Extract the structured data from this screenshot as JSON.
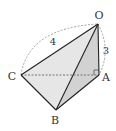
{
  "diagram": {
    "type": "geometry-tetrahedron",
    "vertices": [
      {
        "id": "O",
        "label": "O",
        "x": 98,
        "y": 24,
        "lx": 99,
        "ly": 19
      },
      {
        "id": "A",
        "label": "A",
        "x": 99,
        "y": 75,
        "lx": 106,
        "ly": 81
      },
      {
        "id": "C",
        "label": "C",
        "x": 21,
        "y": 75,
        "lx": 12,
        "ly": 80
      },
      {
        "id": "B",
        "label": "B",
        "x": 56,
        "y": 110,
        "lx": 55,
        "ly": 124
      }
    ],
    "edges_solid": [
      [
        "O",
        "C"
      ],
      [
        "O",
        "B"
      ],
      [
        "O",
        "A"
      ],
      [
        "C",
        "B"
      ],
      [
        "B",
        "A"
      ]
    ],
    "edges_dashed": [
      [
        "C",
        "A"
      ]
    ],
    "dimensions": [
      {
        "label": "4",
        "between": [
          "C",
          "O"
        ],
        "lx": 53,
        "ly": 45
      },
      {
        "label": "3",
        "between": [
          "O",
          "A"
        ],
        "lx": 106,
        "ly": 54
      }
    ],
    "right_angle_at": "A",
    "colors": {
      "line": "#222222",
      "face_light": "#e4e4e4",
      "face_dark": "#cfcfcf",
      "dashed": "#888888"
    }
  }
}
